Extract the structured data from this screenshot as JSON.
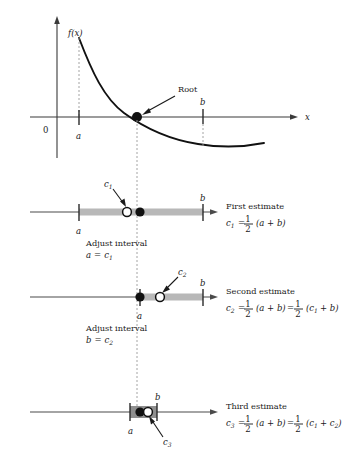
{
  "figure": {
    "title_semantic": "bisection-method-root-finding-diagram",
    "graph": {
      "y_axis_label": "",
      "x_axis_label": "x",
      "origin_label": "0",
      "function_label": "f(x)",
      "root_label": "Root",
      "tick_a": "a",
      "tick_b": "b"
    },
    "steps": [
      {
        "id": "first",
        "estimate_title": "First estimate",
        "point_label": "c",
        "point_sub": "1",
        "left_tick": "a",
        "right_tick": "b",
        "adjust_text": "Adjust interval",
        "adjust_assign_var": "a",
        "adjust_assign_eq": "=",
        "adjust_assign_val": "c",
        "adjust_assign_sub": "1",
        "formula": {
          "lhs": "c",
          "lhs_sub": "1",
          "eq1": "=",
          "num": "1",
          "den": "2",
          "term1": "(a + b)"
        }
      },
      {
        "id": "second",
        "estimate_title": "Second estimate",
        "point_label": "c",
        "point_sub": "2",
        "left_tick": "a",
        "right_tick": "b",
        "adjust_text": "Adjust interval",
        "adjust_assign_var": "b",
        "adjust_assign_eq": "=",
        "adjust_assign_val": "c",
        "adjust_assign_sub": "2",
        "formula": {
          "lhs": "c",
          "lhs_sub": "2",
          "eq1": "=",
          "num": "1",
          "den": "2",
          "term1": "(a + b)",
          "eq2": "=",
          "num2": "1",
          "den2": "2",
          "term2_open": "(c",
          "term2_sub": "1",
          "term2_close": "+ b)"
        }
      },
      {
        "id": "third",
        "estimate_title": "Third estimate",
        "point_label": "c",
        "point_sub": "3",
        "left_tick": "a",
        "right_tick": "b",
        "formula": {
          "lhs": "c",
          "lhs_sub": "3",
          "eq1": "=",
          "num": "1",
          "den": "2",
          "term1": "(a + b)",
          "eq2": "=",
          "num2": "1",
          "den2": "2",
          "term2_open": "(c",
          "term2_sub": "1",
          "term2_mid": "+ c",
          "term2_sub2": "2",
          "term2_close": ")"
        }
      }
    ]
  },
  "colors": {
    "ink": "#111111",
    "axis": "#3a3a3a",
    "band": "#b8b8b8",
    "guide": "#9a9a9a"
  }
}
